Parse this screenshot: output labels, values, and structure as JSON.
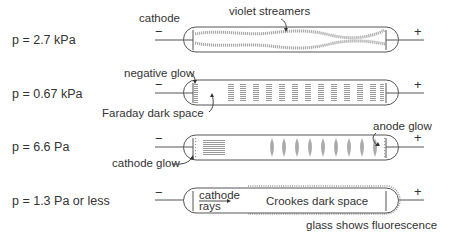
{
  "diagram": {
    "rows": [
      {
        "pressure_label": "p = 2.7 kPa",
        "annotations": [
          "cathode",
          "violet streamers"
        ],
        "cathode_sign": "−",
        "anode_sign": "+"
      },
      {
        "pressure_label": "p = 0.67 kPa",
        "annotations": [
          "negative glow",
          "Faraday dark space"
        ],
        "cathode_sign": "−",
        "anode_sign": "+"
      },
      {
        "pressure_label": "p = 6.6 Pa",
        "annotations": [
          "cathode glow",
          "anode glow"
        ],
        "cathode_sign": "−",
        "anode_sign": "+"
      },
      {
        "pressure_label": "p = 1.3 Pa or less",
        "annotations": [
          "cathode",
          "rays",
          "Crookes dark space",
          "glass shows fluorescence"
        ],
        "cathode_sign": "−",
        "anode_sign": "+"
      }
    ],
    "colors": {
      "line": "#555555",
      "glow": "#aaaaaa",
      "text": "#333333"
    }
  }
}
